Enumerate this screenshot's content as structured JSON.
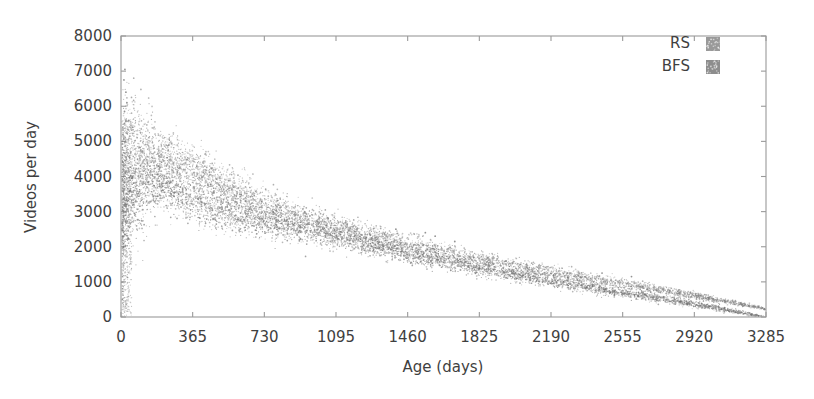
{
  "chart_data": {
    "type": "scatter",
    "title": "",
    "xlabel": "Age (days)",
    "ylabel": "Videos per day",
    "xlim": [
      0,
      3285
    ],
    "ylim": [
      0,
      8000
    ],
    "xticks": [
      0,
      365,
      730,
      1095,
      1460,
      1825,
      2190,
      2555,
      2920,
      3285
    ],
    "yticks": [
      0,
      1000,
      2000,
      3000,
      4000,
      5000,
      6000,
      7000,
      8000
    ],
    "xtick_labels": [
      "0",
      "365",
      "730",
      "1095",
      "1460",
      "1825",
      "2190",
      "2555",
      "2920",
      "3285"
    ],
    "ytick_labels": [
      "0",
      "1000",
      "2000",
      "3000",
      "4000",
      "5000",
      "6000",
      "7000",
      "8000"
    ],
    "grid": false,
    "legend_position": "top-right",
    "marker": "point",
    "series": [
      {
        "name": "RS",
        "color": "#808080",
        "description": "Random sampling: dense decaying cloud of videos-per-day vs age",
        "trend_points": [
          {
            "x": 0,
            "y": 3600
          },
          {
            "x": 30,
            "y": 4400
          },
          {
            "x": 120,
            "y": 4500
          },
          {
            "x": 240,
            "y": 4400
          },
          {
            "x": 365,
            "y": 4150
          },
          {
            "x": 500,
            "y": 3650
          },
          {
            "x": 640,
            "y": 3300
          },
          {
            "x": 730,
            "y": 3050
          },
          {
            "x": 900,
            "y": 2750
          },
          {
            "x": 1095,
            "y": 2450
          },
          {
            "x": 1280,
            "y": 2180
          },
          {
            "x": 1460,
            "y": 1950
          },
          {
            "x": 1640,
            "y": 1720
          },
          {
            "x": 1825,
            "y": 1520
          },
          {
            "x": 2010,
            "y": 1340
          },
          {
            "x": 2190,
            "y": 1160
          },
          {
            "x": 2370,
            "y": 1000
          },
          {
            "x": 2555,
            "y": 840
          },
          {
            "x": 2740,
            "y": 670
          },
          {
            "x": 2920,
            "y": 500
          },
          {
            "x": 3100,
            "y": 320
          },
          {
            "x": 3285,
            "y": 120
          }
        ],
        "spread": [
          {
            "x": 0,
            "half_width": 2600
          },
          {
            "x": 200,
            "half_width": 900
          },
          {
            "x": 500,
            "half_width": 700
          },
          {
            "x": 1000,
            "half_width": 470
          },
          {
            "x": 1600,
            "half_width": 330
          },
          {
            "x": 2200,
            "half_width": 230
          },
          {
            "x": 2800,
            "half_width": 140
          },
          {
            "x": 3285,
            "half_width": 50
          }
        ]
      },
      {
        "name": "BFS",
        "color": "#707070",
        "description": "Breadth-first sampling: overlapping lower band, slightly below RS",
        "trend_points": [
          {
            "x": 0,
            "y": 3100
          },
          {
            "x": 60,
            "y": 3750
          },
          {
            "x": 150,
            "y": 3900
          },
          {
            "x": 280,
            "y": 3700
          },
          {
            "x": 365,
            "y": 3450
          },
          {
            "x": 520,
            "y": 3150
          },
          {
            "x": 730,
            "y": 2850
          },
          {
            "x": 950,
            "y": 2600
          },
          {
            "x": 1095,
            "y": 2400
          },
          {
            "x": 1300,
            "y": 2120
          },
          {
            "x": 1460,
            "y": 1900
          },
          {
            "x": 1650,
            "y": 1680
          },
          {
            "x": 1825,
            "y": 1480
          },
          {
            "x": 2020,
            "y": 1300
          },
          {
            "x": 2190,
            "y": 1130
          },
          {
            "x": 2380,
            "y": 960
          },
          {
            "x": 2555,
            "y": 800
          },
          {
            "x": 2750,
            "y": 630
          },
          {
            "x": 2920,
            "y": 470
          },
          {
            "x": 3110,
            "y": 290
          },
          {
            "x": 3285,
            "y": 100
          }
        ],
        "spread": [
          {
            "x": 0,
            "half_width": 2200
          },
          {
            "x": 200,
            "half_width": 850
          },
          {
            "x": 500,
            "half_width": 650
          },
          {
            "x": 1000,
            "half_width": 430
          },
          {
            "x": 1600,
            "half_width": 300
          },
          {
            "x": 2200,
            "half_width": 210
          },
          {
            "x": 2800,
            "half_width": 130
          },
          {
            "x": 3285,
            "half_width": 45
          }
        ]
      }
    ],
    "outliers": [
      {
        "x": 20,
        "y": 7050
      },
      {
        "x": 15,
        "y": 6750
      },
      {
        "x": 25,
        "y": 6400
      },
      {
        "x": 30,
        "y": 6100
      },
      {
        "x": 18,
        "y": 5850
      },
      {
        "x": 40,
        "y": 5600
      },
      {
        "x": 60,
        "y": 5400
      },
      {
        "x": 10,
        "y": 5200
      },
      {
        "x": 1550,
        "y": 2400
      },
      {
        "x": 1600,
        "y": 2300
      },
      {
        "x": 1700,
        "y": 2150
      },
      {
        "x": 1400,
        "y": 2500
      },
      {
        "x": 2450,
        "y": 1250
      },
      {
        "x": 2600,
        "y": 1150
      }
    ]
  },
  "legend": {
    "entries": [
      {
        "label": "RS",
        "swatch_color": "#808080"
      },
      {
        "label": "BFS",
        "swatch_color": "#707070"
      }
    ]
  },
  "axes": {
    "x_title": "Age (days)",
    "y_title": "Videos per day"
  }
}
